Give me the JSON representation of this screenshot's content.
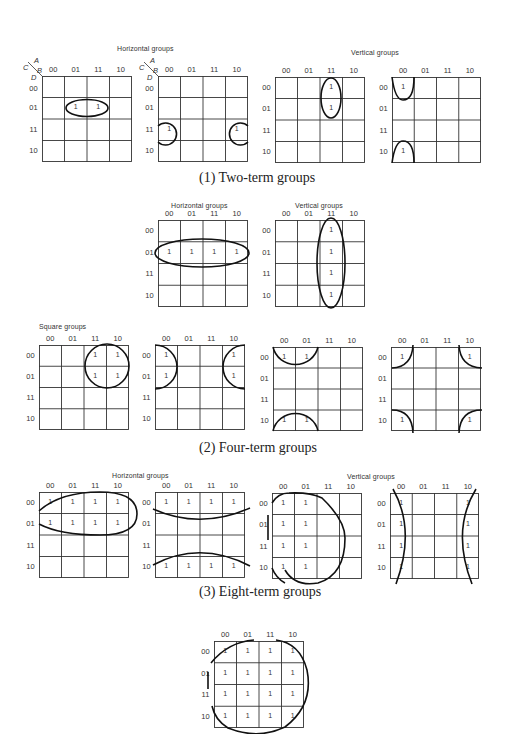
{
  "figure": {
    "sections": [
      {
        "id": "two-term",
        "caption": "(1)  Two-term groups"
      },
      {
        "id": "four-term",
        "caption": "(2)  Four-term groups"
      },
      {
        "id": "eight-term",
        "caption": "(3)  Eight-term groups"
      }
    ],
    "group_labels": {
      "horizontal": "Horizontal groups",
      "vertical": "Vertical groups",
      "square": "Square groups"
    },
    "axis_labels": {
      "A": "A",
      "B": "B",
      "C": "C",
      "D": "D"
    },
    "col_labels": [
      "00",
      "01",
      "11",
      "10"
    ],
    "row_labels": [
      "00",
      "01",
      "11",
      "10"
    ],
    "one": "1",
    "maps": [
      {
        "id": "two-h1",
        "x": 42,
        "y": 76,
        "w": 90,
        "h": 86,
        "axes": true,
        "ones": [
          [
            1,
            1
          ],
          [
            1,
            2
          ]
        ]
      },
      {
        "id": "two-h2",
        "x": 158,
        "y": 76,
        "w": 90,
        "h": 86,
        "axes": true,
        "ones": [
          [
            2,
            0
          ],
          [
            2,
            3
          ]
        ]
      },
      {
        "id": "two-v1",
        "x": 275,
        "y": 77,
        "w": 90,
        "h": 86,
        "axes": false,
        "ones": [
          [
            0,
            2
          ],
          [
            1,
            2
          ]
        ]
      },
      {
        "id": "two-v2",
        "x": 392,
        "y": 77,
        "w": 89,
        "h": 86,
        "axes": false,
        "ones": [
          [
            0,
            0
          ],
          [
            3,
            0
          ]
        ]
      },
      {
        "id": "four-h",
        "x": 158,
        "y": 220,
        "w": 90,
        "h": 87,
        "axes": false,
        "ones": [
          [
            1,
            0
          ],
          [
            1,
            1
          ],
          [
            1,
            2
          ],
          [
            1,
            3
          ]
        ]
      },
      {
        "id": "four-v",
        "x": 275,
        "y": 220,
        "w": 90,
        "h": 87,
        "axes": false,
        "ones": [
          [
            0,
            2
          ],
          [
            1,
            2
          ],
          [
            2,
            2
          ],
          [
            3,
            2
          ]
        ]
      },
      {
        "id": "four-s1",
        "x": 39,
        "y": 345,
        "w": 90,
        "h": 85,
        "axes": false,
        "ones": [
          [
            0,
            2
          ],
          [
            0,
            3
          ],
          [
            1,
            2
          ],
          [
            1,
            3
          ]
        ]
      },
      {
        "id": "four-s2",
        "x": 155,
        "y": 345,
        "w": 90,
        "h": 85,
        "axes": false,
        "ones": [
          [
            0,
            0
          ],
          [
            1,
            0
          ],
          [
            0,
            3
          ],
          [
            1,
            3
          ]
        ]
      },
      {
        "id": "four-s3",
        "x": 273,
        "y": 347,
        "w": 90,
        "h": 84,
        "axes": false,
        "ones": [
          [
            0,
            0
          ],
          [
            0,
            1
          ],
          [
            3,
            0
          ],
          [
            3,
            1
          ]
        ]
      },
      {
        "id": "four-s4",
        "x": 391,
        "y": 347,
        "w": 90,
        "h": 84,
        "axes": false,
        "ones": [
          [
            0,
            0
          ],
          [
            0,
            3
          ],
          [
            3,
            0
          ],
          [
            3,
            3
          ]
        ]
      },
      {
        "id": "eight-h1",
        "x": 39,
        "y": 492,
        "w": 90,
        "h": 86,
        "axes": false,
        "ones": [
          [
            0,
            0
          ],
          [
            0,
            1
          ],
          [
            0,
            2
          ],
          [
            0,
            3
          ],
          [
            1,
            0
          ],
          [
            1,
            1
          ],
          [
            1,
            2
          ],
          [
            1,
            3
          ]
        ]
      },
      {
        "id": "eight-h2",
        "x": 155,
        "y": 492,
        "w": 90,
        "h": 86,
        "axes": false,
        "ones": [
          [
            0,
            0
          ],
          [
            0,
            1
          ],
          [
            0,
            2
          ],
          [
            0,
            3
          ],
          [
            3,
            0
          ],
          [
            3,
            1
          ],
          [
            3,
            2
          ],
          [
            3,
            3
          ]
        ]
      },
      {
        "id": "eight-v1",
        "x": 272,
        "y": 493,
        "w": 90,
        "h": 86,
        "axes": false,
        "ones": [
          [
            0,
            0
          ],
          [
            1,
            0
          ],
          [
            2,
            0
          ],
          [
            3,
            0
          ],
          [
            0,
            1
          ],
          [
            1,
            1
          ],
          [
            2,
            1
          ],
          [
            3,
            1
          ]
        ]
      },
      {
        "id": "eight-v2",
        "x": 390,
        "y": 493,
        "w": 89,
        "h": 86,
        "axes": false,
        "ones": [
          [
            0,
            0
          ],
          [
            1,
            0
          ],
          [
            2,
            0
          ],
          [
            3,
            0
          ],
          [
            0,
            3
          ],
          [
            1,
            3
          ],
          [
            2,
            3
          ],
          [
            3,
            3
          ]
        ]
      },
      {
        "id": "sixteen",
        "x": 214,
        "y": 641,
        "w": 90,
        "h": 87,
        "axes": false,
        "ones": "all"
      }
    ]
  }
}
